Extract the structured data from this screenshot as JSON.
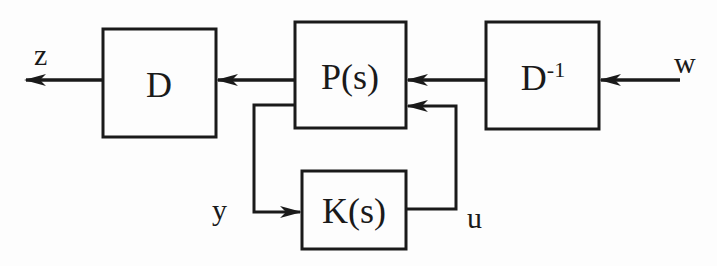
{
  "diagram": {
    "type": "block-diagram",
    "title": "",
    "blocks": [
      {
        "id": "D",
        "label": "D",
        "x": 103,
        "y": 29,
        "w": 113,
        "h": 108
      },
      {
        "id": "P",
        "label": "P(s)",
        "x": 295,
        "y": 22,
        "w": 111,
        "h": 106
      },
      {
        "id": "Dinv",
        "label": "D",
        "sup": "-1",
        "x": 486,
        "y": 22,
        "w": 113,
        "h": 107
      },
      {
        "id": "K",
        "label": "K(s)",
        "x": 302,
        "y": 171,
        "w": 104,
        "h": 78
      }
    ],
    "signals": [
      {
        "id": "z",
        "label": "z"
      },
      {
        "id": "w",
        "label": "w"
      },
      {
        "id": "y",
        "label": "y"
      },
      {
        "id": "u",
        "label": "u"
      }
    ],
    "edges": [
      {
        "from": "w",
        "to": "Dinv"
      },
      {
        "from": "Dinv",
        "to": "P"
      },
      {
        "from": "P",
        "to": "D"
      },
      {
        "from": "D",
        "to": "z"
      },
      {
        "from": "P",
        "to": "K",
        "signal": "y"
      },
      {
        "from": "K",
        "to": "P",
        "signal": "u"
      }
    ],
    "colors": {
      "stroke": "#1a1a1a",
      "background": "#fdfdfd"
    }
  }
}
